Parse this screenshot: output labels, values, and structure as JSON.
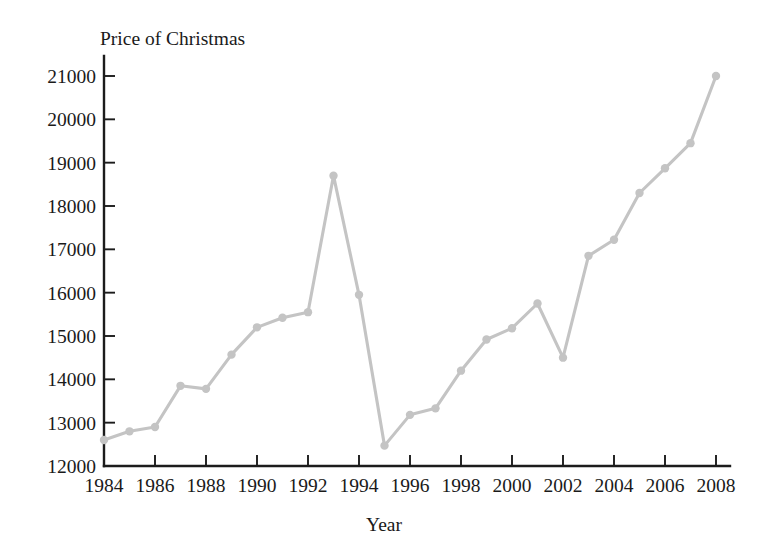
{
  "chart_data": {
    "type": "line",
    "title": "Price of Christmas",
    "xlabel": "Year",
    "ylabel": "",
    "x": [
      1984,
      1985,
      1986,
      1987,
      1988,
      1989,
      1990,
      1991,
      1992,
      1993,
      1994,
      1995,
      1996,
      1997,
      1998,
      1999,
      2000,
      2001,
      2002,
      2003,
      2004,
      2005,
      2006,
      2007,
      2008
    ],
    "values": [
      12600,
      12800,
      12900,
      13850,
      13780,
      14570,
      15200,
      15420,
      15550,
      18700,
      15950,
      12470,
      13180,
      13330,
      14200,
      14920,
      15180,
      15750,
      14500,
      16850,
      17220,
      18300,
      18870,
      19450,
      21000
    ],
    "series": [
      {
        "name": "Price of Christmas",
        "values": [
          12600,
          12800,
          12900,
          13850,
          13780,
          14570,
          15200,
          15420,
          15550,
          18700,
          15950,
          12470,
          13180,
          13330,
          14200,
          14920,
          15180,
          15750,
          14500,
          16850,
          17220,
          18300,
          18870,
          19450,
          21000
        ]
      }
    ],
    "xlim": [
      1983.5,
      2008.5
    ],
    "ylim": [
      12000,
      21400
    ],
    "xticks": [
      1984,
      1986,
      1988,
      1990,
      1992,
      1994,
      1996,
      1998,
      2000,
      2002,
      2004,
      2006,
      2008
    ],
    "xtick_labels": [
      "1984",
      "1986",
      "1988",
      "1990",
      "1992",
      "1994",
      "1996",
      "1998",
      "2000",
      "2002",
      "2004",
      "2006",
      "2008"
    ],
    "yticks": [
      12000,
      13000,
      14000,
      15000,
      16000,
      17000,
      18000,
      19000,
      20000,
      21000
    ],
    "ytick_labels": [
      "12000",
      "13000",
      "14000",
      "15000",
      "16000",
      "17000",
      "18000",
      "19000",
      "20000",
      "21000"
    ],
    "grid": false,
    "legend": false,
    "line_color": "#c4c4c4",
    "marker_color": "#c4c4c4",
    "axis_color": "#1c1c1c",
    "background_color": "#ffffff"
  }
}
